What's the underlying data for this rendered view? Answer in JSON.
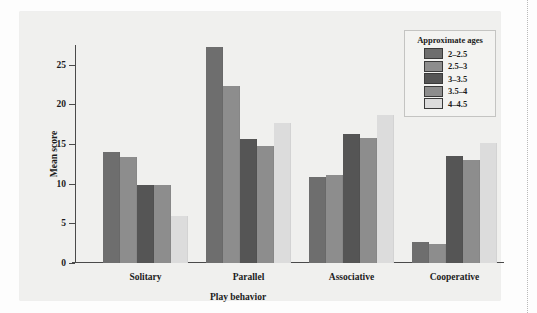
{
  "chart_data": {
    "type": "bar",
    "title": "",
    "xlabel": "Play behavior",
    "ylabel": "Mean score",
    "categories": [
      "Solitary",
      "Parallel",
      "Associative",
      "Cooperative"
    ],
    "ylim": [
      0,
      27.5
    ],
    "yticks": [
      0,
      5,
      10,
      15,
      20,
      25
    ],
    "ytick_labels": [
      "0",
      "5",
      "10",
      "15",
      "20",
      "25"
    ],
    "grid": false,
    "legend_position": "top-right",
    "legend_title": "Approximate ages",
    "series": [
      {
        "name": "2–2.5",
        "color": "#6e6e6e",
        "values": [
          14.0,
          27.3,
          10.9,
          2.6
        ]
      },
      {
        "name": "2.5–3",
        "color": "#8d8d8d",
        "values": [
          13.4,
          22.3,
          11.1,
          2.4
        ]
      },
      {
        "name": "3–3.5",
        "color": "#555555",
        "values": [
          9.8,
          15.6,
          16.3,
          13.5
        ]
      },
      {
        "name": "3.5–4",
        "color": "#8d8d8d",
        "values": [
          9.8,
          14.8,
          15.8,
          13.0
        ]
      },
      {
        "name": "4–4.5",
        "color": "#dcdcdc",
        "values": [
          5.9,
          17.7,
          18.7,
          15.2
        ]
      }
    ]
  },
  "legend": {
    "title": "Approximate ages",
    "entries": [
      {
        "label": "2–2.5",
        "color": "#6e6e6e"
      },
      {
        "label": "2.5–3",
        "color": "#8d8d8d"
      },
      {
        "label": "3–3.5",
        "color": "#555555"
      },
      {
        "label": "3.5–4",
        "color": "#8d8d8d"
      },
      {
        "label": "4–4.5",
        "color": "#dcdcdc"
      }
    ]
  },
  "axes": {
    "y_title": "Mean score",
    "x_title": "Play behavior"
  }
}
